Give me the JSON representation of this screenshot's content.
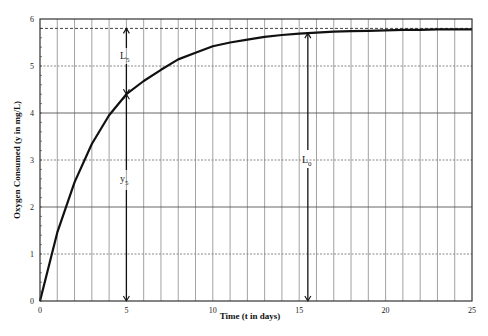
{
  "chart_data": {
    "type": "line",
    "title": "",
    "xlabel": "Time (t in days)",
    "ylabel": "Oxygen Consumed (y in mg/L)",
    "xlim": [
      0,
      25
    ],
    "ylim": [
      0,
      6
    ],
    "x_ticks": [
      0,
      5,
      10,
      15,
      20,
      25
    ],
    "y_ticks": [
      0,
      1,
      2,
      3,
      4,
      5,
      6
    ],
    "grid": true,
    "legend": "none",
    "series": [
      {
        "name": "BOD curve",
        "x": [
          0,
          1,
          2,
          3,
          4,
          5,
          6,
          7,
          8,
          9,
          10,
          11,
          12,
          13,
          14,
          15,
          16,
          17,
          18,
          19,
          20,
          21,
          22,
          23,
          24,
          25
        ],
        "values": [
          0,
          1.46,
          2.53,
          3.34,
          3.95,
          4.4,
          4.68,
          4.92,
          5.14,
          5.28,
          5.42,
          5.5,
          5.56,
          5.62,
          5.66,
          5.69,
          5.71,
          5.73,
          5.74,
          5.75,
          5.76,
          5.77,
          5.77,
          5.78,
          5.78,
          5.78
        ]
      }
    ],
    "reference_lines": [
      {
        "type": "horizontal",
        "y": 5.8,
        "style": "dashed",
        "label": "L0 asymptote"
      }
    ],
    "annotations": [
      {
        "text": "L",
        "subscript": "5",
        "x": 5,
        "y_from": 4.4,
        "y_to": 5.8,
        "type": "double-arrow"
      },
      {
        "text": "y",
        "subscript": "5",
        "x": 5,
        "y_from": 0,
        "y_to": 4.4,
        "type": "double-arrow"
      },
      {
        "text": "L",
        "subscript": "0",
        "x": 15.5,
        "y_from": 0,
        "y_to": 5.7,
        "type": "double-arrow"
      }
    ]
  },
  "labels": {
    "xlabel": "Time (t in days)",
    "ylabel": "Oxygen Consumed (y in mg/L)",
    "L5": "L",
    "L5_sub": "5",
    "y5": "y",
    "y5_sub": "5",
    "L0": "L",
    "L0_sub": "0"
  },
  "colors": {
    "curve": "#111111",
    "frame": "#333333",
    "grid": "#999999",
    "text": "#222222"
  }
}
